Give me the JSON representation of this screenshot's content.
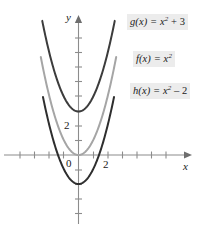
{
  "chart_data": {
    "type": "line",
    "title": "",
    "xlabel": "x",
    "ylabel": "y",
    "xlim": [
      -5.4,
      7.6
    ],
    "ylim": [
      -5.0,
      9.9
    ],
    "grid": false,
    "legend_position": "right",
    "axis_labels": {
      "x": "x",
      "y": "y"
    },
    "tick_labels": {
      "origin": "0",
      "x_ticks": [
        "2"
      ],
      "y_ticks": [
        "2"
      ],
      "x_tick_values": [
        2
      ],
      "y_tick_values": [
        2
      ],
      "tick_spacing": 1
    },
    "series": [
      {
        "name": "g",
        "label": "g(x) = x",
        "label_exponent": "2",
        "label_tail": " + 3",
        "equation": "g(x) = x^2 + 3",
        "color": "#3c3c3c",
        "vertex": [
          0,
          3
        ],
        "coefficient": 1,
        "offset": 3,
        "x_domain": [
          -2.5,
          2.5
        ]
      },
      {
        "name": "f",
        "label": "f(x) = x",
        "label_exponent": "2",
        "label_tail": "",
        "equation": "f(x) = x^2",
        "color": "#a5a5a5",
        "vertex": [
          0,
          0
        ],
        "coefficient": 1,
        "offset": 0,
        "x_domain": [
          -2.6,
          2.6
        ]
      },
      {
        "name": "h",
        "label": "h(x) = x",
        "label_exponent": "2",
        "label_tail": " – 2",
        "equation": "h(x) = x^2 - 2",
        "color": "#2e2e2e",
        "vertex": [
          0,
          -2
        ],
        "coefficient": 1,
        "offset": -2,
        "x_domain": [
          -2.45,
          2.45
        ]
      }
    ],
    "colors": {
      "axis": "#8c8c8c",
      "text": "#1a1a1a",
      "label_background": "#ececec",
      "curve_dark": "#3c3c3c",
      "curve_light": "#a5a5a5"
    }
  }
}
